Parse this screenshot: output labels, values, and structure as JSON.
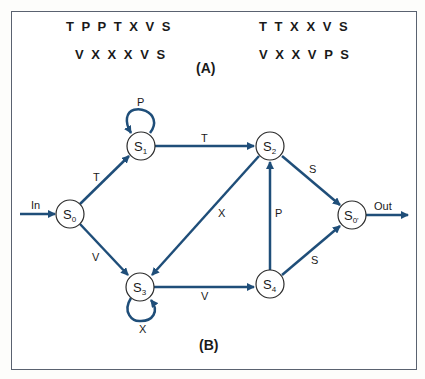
{
  "panel_a": {
    "label": "(A)",
    "sequences": [
      "T P P T X V S",
      "T T X X V S",
      "V X X X V S",
      "V X X V P S"
    ]
  },
  "panel_b": {
    "label": "(B)",
    "nodes": [
      {
        "id": "S0",
        "main": "S",
        "sub": "0"
      },
      {
        "id": "S1",
        "main": "S",
        "sub": "1"
      },
      {
        "id": "S2",
        "main": "S",
        "sub": "2"
      },
      {
        "id": "S3",
        "main": "S",
        "sub": "3"
      },
      {
        "id": "S4",
        "main": "S",
        "sub": "4"
      },
      {
        "id": "S0'",
        "main": "S",
        "sub": "0'"
      }
    ],
    "edges": [
      {
        "from": "In",
        "to": "S0",
        "label": "In"
      },
      {
        "from": "S0",
        "to": "S1",
        "label": "T"
      },
      {
        "from": "S0",
        "to": "S3",
        "label": "V"
      },
      {
        "from": "S1",
        "to": "S1",
        "label": "P"
      },
      {
        "from": "S1",
        "to": "S2",
        "label": "T"
      },
      {
        "from": "S2",
        "to": "S3",
        "label": "X"
      },
      {
        "from": "S3",
        "to": "S3",
        "label": "X"
      },
      {
        "from": "S3",
        "to": "S4",
        "label": "V"
      },
      {
        "from": "S4",
        "to": "S2",
        "label": "P"
      },
      {
        "from": "S2",
        "to": "S0'",
        "label": "S"
      },
      {
        "from": "S4",
        "to": "S0'",
        "label": "S"
      },
      {
        "from": "S0'",
        "to": "Out",
        "label": "Out"
      }
    ],
    "colors": {
      "edge": "#1f4e79",
      "node_stroke": "#2a2a2a",
      "frame": "#5a6270"
    }
  }
}
